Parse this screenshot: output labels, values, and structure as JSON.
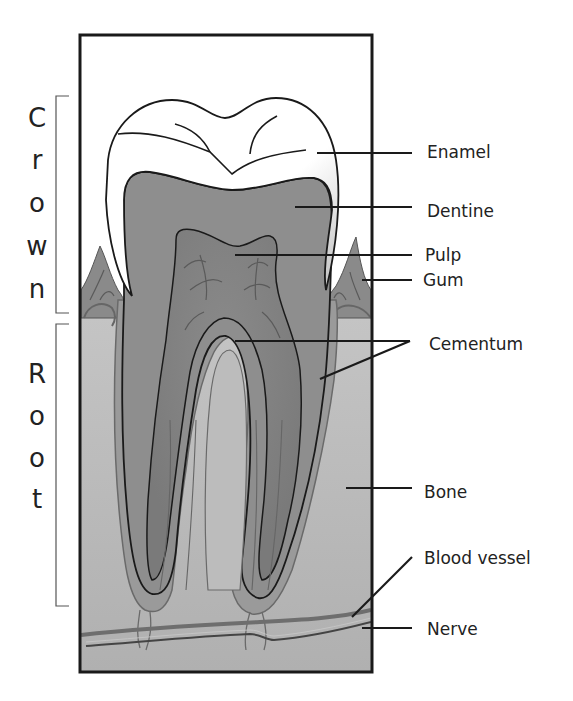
{
  "side_labels": {
    "crown": {
      "text": "Crown",
      "letters": [
        "C",
        "r",
        "o",
        "w",
        "n"
      ]
    },
    "root": {
      "text": "Root",
      "letters": [
        "R",
        "o",
        "o",
        "t"
      ]
    }
  },
  "labels": [
    {
      "id": "enamel",
      "text": "Enamel"
    },
    {
      "id": "dentine",
      "text": "Dentine"
    },
    {
      "id": "pulp",
      "text": "Pulp"
    },
    {
      "id": "gum",
      "text": "Gum"
    },
    {
      "id": "cementum",
      "text": "Cementum"
    },
    {
      "id": "bone",
      "text": "Bone"
    },
    {
      "id": "blood-vessel",
      "text": "Blood vessel"
    },
    {
      "id": "nerve",
      "text": "Nerve"
    }
  ],
  "colors": {
    "frame": "#1a1a1a",
    "enamel": "#ffffff",
    "dentine": "#8e8e8e",
    "pulp": "#7a7a7a",
    "bone": "#b5b5b5",
    "gum": "#8a8a8a",
    "cementum": "#9a9a9a",
    "vessel": "#6e6e6e",
    "text": "#222222"
  }
}
